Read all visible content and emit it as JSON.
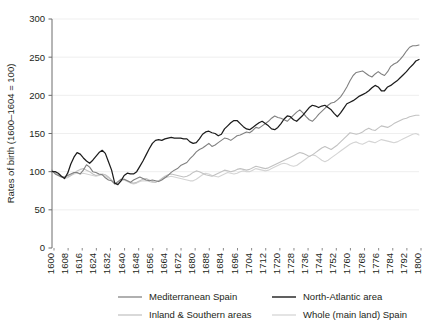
{
  "chart_data": {
    "type": "line",
    "title": "",
    "xlabel": "",
    "ylabel": "Rates of birth (1600–1604 = 100)",
    "ylim": [
      0,
      300
    ],
    "yticks": [
      0,
      50,
      100,
      150,
      200,
      250,
      300
    ],
    "grid": true,
    "legend_position": "bottom",
    "xlim": [
      1600,
      1804
    ],
    "xtick_labels": [
      "1600",
      "1608",
      "1616",
      "1624",
      "1632",
      "1640",
      "1648",
      "1656",
      "1664",
      "1672",
      "1680",
      "1688",
      "1684",
      "1696",
      "1704",
      "1712",
      "1720",
      "1728",
      "1736",
      "1744",
      "1752",
      "1760",
      "1768",
      "1776",
      "1784",
      "1792",
      "1800"
    ],
    "x_start": 1600,
    "x_step": 2,
    "series": [
      {
        "name": "Mediterranean Spain",
        "color": "#808080",
        "width": 1.1,
        "values": [
          102,
          97,
          95,
          93,
          93,
          95,
          97,
          99,
          99,
          97,
          102,
          109,
          106,
          100,
          99,
          97,
          96,
          92,
          89,
          88,
          84,
          87,
          90,
          90,
          88,
          86,
          89,
          91,
          93,
          91,
          89,
          88,
          89,
          88,
          87,
          89,
          92,
          95,
          99,
          102,
          104,
          108,
          110,
          112,
          117,
          121,
          126,
          129,
          131,
          134,
          137,
          133,
          135,
          138,
          141,
          144,
          143,
          141,
          144,
          147,
          148,
          150,
          152,
          151,
          154,
          158,
          157,
          160,
          163,
          166,
          170,
          173,
          171,
          170,
          168,
          166,
          170,
          174,
          178,
          181,
          177,
          172,
          168,
          166,
          170,
          175,
          179,
          183,
          187,
          190,
          191,
          194,
          198,
          204,
          211,
          219,
          226,
          230,
          231,
          232,
          229,
          226,
          224,
          228,
          231,
          228,
          226,
          231,
          238,
          241,
          243,
          247,
          252,
          258,
          263,
          265,
          265,
          266
        ]
      },
      {
        "name": "North-Atlantic area",
        "color": "#1c1c1c",
        "width": 1.25,
        "values": [
          100,
          100,
          98,
          94,
          91,
          98,
          110,
          119,
          125,
          123,
          118,
          114,
          111,
          115,
          120,
          125,
          128,
          124,
          113,
          102,
          85,
          83,
          88,
          95,
          98,
          97,
          97,
          100,
          107,
          114,
          122,
          130,
          137,
          141,
          142,
          141,
          143,
          144,
          145,
          144,
          144,
          144,
          143,
          143,
          139,
          137,
          138,
          143,
          149,
          152,
          153,
          151,
          150,
          147,
          149,
          156,
          160,
          164,
          167,
          167,
          163,
          159,
          156,
          155,
          158,
          161,
          164,
          166,
          163,
          160,
          156,
          155,
          158,
          163,
          169,
          173,
          172,
          168,
          166,
          170,
          174,
          179,
          184,
          187,
          186,
          184,
          186,
          187,
          184,
          181,
          176,
          172,
          177,
          183,
          189,
          191,
          193,
          196,
          199,
          201,
          203,
          206,
          210,
          213,
          211,
          206,
          206,
          211,
          213,
          216,
          219,
          223,
          227,
          231,
          236,
          240,
          245,
          247
        ]
      },
      {
        "name": "Inland & Southern areas",
        "color": "#c2c2c2",
        "width": 1.1,
        "values": [
          100,
          98,
          96,
          94,
          92,
          93,
          95,
          98,
          101,
          103,
          104,
          102,
          100,
          97,
          95,
          96,
          97,
          96,
          93,
          89,
          84,
          86,
          89,
          90,
          88,
          86,
          85,
          86,
          88,
          90,
          91,
          89,
          87,
          86,
          88,
          91,
          94,
          96,
          97,
          96,
          95,
          94,
          93,
          94,
          96,
          99,
          101,
          100,
          98,
          96,
          95,
          94,
          96,
          98,
          100,
          102,
          101,
          100,
          101,
          103,
          104,
          103,
          102,
          103,
          105,
          107,
          106,
          105,
          104,
          105,
          107,
          109,
          111,
          113,
          115,
          117,
          119,
          121,
          123,
          125,
          124,
          122,
          120,
          122,
          125,
          128,
          131,
          133,
          131,
          129,
          132,
          135,
          139,
          143,
          147,
          151,
          150,
          149,
          150,
          152,
          155,
          157,
          155,
          154,
          157,
          160,
          159,
          158,
          160,
          163,
          165,
          167,
          169,
          170,
          172,
          173,
          174,
          174
        ]
      },
      {
        "name": "Whole (main land) Spain",
        "color": "#d4d4d4",
        "width": 1.1,
        "values": [
          100,
          98,
          95,
          93,
          91,
          92,
          95,
          97,
          98,
          97,
          98,
          97,
          96,
          95,
          94,
          95,
          96,
          94,
          92,
          89,
          84,
          85,
          88,
          89,
          87,
          85,
          84,
          85,
          87,
          88,
          88,
          87,
          86,
          86,
          88,
          90,
          92,
          93,
          94,
          93,
          92,
          91,
          90,
          89,
          88,
          88,
          90,
          93,
          96,
          98,
          97,
          95,
          94,
          93,
          95,
          97,
          99,
          98,
          97,
          98,
          100,
          101,
          100,
          100,
          102,
          104,
          103,
          102,
          101,
          102,
          104,
          106,
          108,
          110,
          111,
          110,
          108,
          107,
          108,
          111,
          114,
          117,
          120,
          122,
          121,
          118,
          115,
          113,
          115,
          118,
          121,
          124,
          127,
          130,
          133,
          136,
          138,
          139,
          137,
          136,
          138,
          140,
          139,
          138,
          140,
          142,
          141,
          140,
          139,
          138,
          139,
          141,
          143,
          145,
          147,
          149,
          150,
          148
        ]
      }
    ]
  },
  "legend": {
    "items": [
      {
        "label": "Mediterranean Spain"
      },
      {
        "label": "North-Atlantic area"
      },
      {
        "label": "Inland & Southern areas"
      },
      {
        "label": "Whole (main land) Spain"
      }
    ]
  },
  "style": {
    "axis_color": "#6d6d6d",
    "grid_color": "#e8e8e8",
    "text_color": "#231f20"
  }
}
